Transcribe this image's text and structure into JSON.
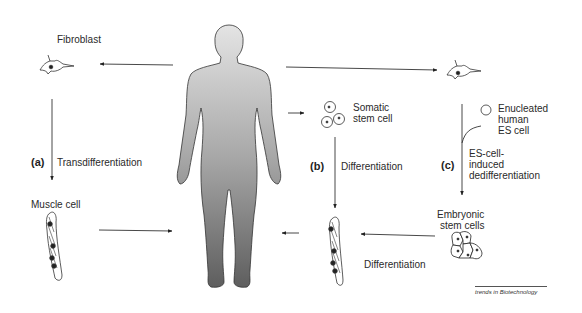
{
  "diagram": {
    "human_figure": "human-body-silhouette",
    "labels": {
      "fibroblast": "Fibroblast",
      "muscle_cell": "Muscle cell",
      "transdifferentiation": "Transdifferentiation",
      "somatic_stem_cell_line1": "Somatic",
      "somatic_stem_cell_line2": "stem cell",
      "differentiation_b": "Differentiation",
      "enucleated_line1": "Enucleated",
      "enucleated_line2": "human",
      "enucleated_line3": "ES cell",
      "dedifferentiation_line1": "ES-cell-",
      "dedifferentiation_line2": "induced",
      "dedifferentiation_line3": "dedifferentiation",
      "embryonic_line1": "Embryonic",
      "embryonic_line2": "stem cells",
      "differentiation_c": "Differentiation"
    },
    "pathway_tags": {
      "a": "(a)",
      "b": "(b)",
      "c": "(c)"
    },
    "credit": "trends in Biotechnology",
    "colors": {
      "line": "#333333",
      "figure_top": "#e2e2e2",
      "figure_bottom": "#6a6a6a"
    }
  }
}
